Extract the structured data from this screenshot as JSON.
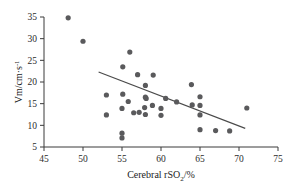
{
  "chart_data": {
    "type": "scatter",
    "title": "",
    "xlabel": "Cerebral rSO2/%",
    "xlabel_parts": {
      "main": "Cerebral rSO",
      "sub": "2",
      "tail": "/%"
    },
    "ylabel": "Vm/cm·s-1",
    "ylabel_parts": {
      "main": "Vm/cm·s",
      "sup": "-1"
    },
    "xlim": [
      45,
      75
    ],
    "ylim": [
      5,
      35
    ],
    "xticks": [
      45,
      50,
      55,
      60,
      65,
      70,
      75
    ],
    "yticks": [
      5,
      10,
      15,
      20,
      25,
      30,
      35
    ],
    "xtick_labels": [
      "45",
      "50",
      "55",
      "60",
      "65",
      "70",
      "75"
    ],
    "ytick_labels": [
      "5",
      "10",
      "15",
      "20",
      "25",
      "30",
      "35"
    ],
    "grid": false,
    "legend": false,
    "point_color": "#5a5a5c",
    "line_color": "#4a4a4a",
    "axis_color": "#3a3a3a",
    "point_radius": 2.6,
    "points": [
      {
        "x": 48.1,
        "y": 34.8
      },
      {
        "x": 50.0,
        "y": 29.4
      },
      {
        "x": 56.0,
        "y": 26.9
      },
      {
        "x": 55.1,
        "y": 23.5
      },
      {
        "x": 57.0,
        "y": 21.7
      },
      {
        "x": 59.0,
        "y": 21.6
      },
      {
        "x": 58.0,
        "y": 19.2
      },
      {
        "x": 63.9,
        "y": 19.4
      },
      {
        "x": 53.0,
        "y": 17.0
      },
      {
        "x": 55.1,
        "y": 17.2
      },
      {
        "x": 55.8,
        "y": 15.5
      },
      {
        "x": 58.1,
        "y": 16.2
      },
      {
        "x": 58.0,
        "y": 16.5
      },
      {
        "x": 60.6,
        "y": 16.2
      },
      {
        "x": 62.0,
        "y": 15.4
      },
      {
        "x": 65.0,
        "y": 16.6
      },
      {
        "x": 64.0,
        "y": 14.7
      },
      {
        "x": 65.0,
        "y": 14.6
      },
      {
        "x": 58.9,
        "y": 14.6
      },
      {
        "x": 57.9,
        "y": 14.1
      },
      {
        "x": 60.0,
        "y": 13.9
      },
      {
        "x": 55.0,
        "y": 13.9
      },
      {
        "x": 56.5,
        "y": 12.9
      },
      {
        "x": 57.2,
        "y": 13.0
      },
      {
        "x": 58.0,
        "y": 12.5
      },
      {
        "x": 60.0,
        "y": 12.3
      },
      {
        "x": 65.0,
        "y": 12.4
      },
      {
        "x": 53.0,
        "y": 12.4
      },
      {
        "x": 71.0,
        "y": 14.0
      },
      {
        "x": 65.0,
        "y": 9.0
      },
      {
        "x": 67.0,
        "y": 8.8
      },
      {
        "x": 68.8,
        "y": 8.7
      },
      {
        "x": 55.0,
        "y": 8.2
      },
      {
        "x": 55.0,
        "y": 7.1
      }
    ],
    "trend_line": {
      "x1": 52.0,
      "y1": 22.3,
      "x2": 70.8,
      "y2": 9.3
    }
  }
}
